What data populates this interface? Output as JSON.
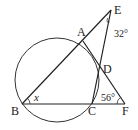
{
  "diagram": {
    "points": {
      "A": {
        "label": "A",
        "x": 83,
        "y": 41
      },
      "B": {
        "label": "B",
        "x": 22,
        "y": 104
      },
      "C": {
        "label": "C",
        "x": 92,
        "y": 104
      },
      "D": {
        "label": "D",
        "x": 100,
        "y": 69
      },
      "E": {
        "label": "E",
        "x": 111,
        "y": 10
      },
      "F": {
        "label": "F",
        "x": 125,
        "y": 104
      }
    },
    "circle": {
      "cx": 57,
      "cy": 80,
      "r": 42
    },
    "angles": {
      "E": "32°",
      "F": "56°",
      "B": "x"
    }
  }
}
